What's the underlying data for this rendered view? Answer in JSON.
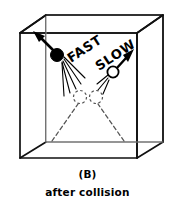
{
  "figure": {
    "panel_label": "(B)",
    "title": "after collision",
    "labels": {
      "fast": "FAST",
      "slow": "SLOW"
    },
    "colors": {
      "ink": "#000000",
      "background": "#ffffff",
      "dark_ball_fill": "#000000",
      "light_ball_fill": "#ffffff",
      "ghost_dash": "#555555",
      "cube_edge": "#1a1a1a"
    },
    "scene": {
      "container_shape": "cube",
      "cube": {
        "front_top_left": [
          20,
          33
        ],
        "front_top_right": [
          137,
          33
        ],
        "front_bottom_left": [
          20,
          158
        ],
        "front_bottom_right": [
          137,
          158
        ],
        "back_top_left": [
          46,
          15
        ],
        "back_top_right": [
          163,
          15
        ],
        "back_bottom_left": [
          46,
          142
        ],
        "back_bottom_right": [
          163,
          142
        ]
      },
      "balls": [
        {
          "name": "fast-dark-ball",
          "label": "FAST",
          "fill": "solid",
          "center": [
            57,
            55
          ],
          "radius": 6.5,
          "direction": "up-left",
          "arrow_tip": [
            34,
            32
          ],
          "speed_lines": 5,
          "speed": "fast"
        },
        {
          "name": "slow-light-ball",
          "label": "SLOW",
          "fill": "open",
          "center": [
            113,
            72
          ],
          "radius": 5.5,
          "direction": "up-right",
          "arrow_tip": [
            133,
            50
          ],
          "speed_lines": 3,
          "speed": "slow"
        }
      ],
      "collision_point": [
        88,
        97
      ],
      "ghost_balls": [
        {
          "name": "ghost-ball-left",
          "center": [
            80,
            97
          ],
          "radius": 6.5
        },
        {
          "name": "ghost-ball-right",
          "center": [
            96,
            97
          ],
          "radius": 6.5
        }
      ],
      "incoming_dashed_paths": [
        {
          "name": "incoming-path-left",
          "from": [
            52,
            140
          ],
          "to": [
            78,
            104
          ]
        },
        {
          "name": "incoming-path-right",
          "from": [
            124,
            140
          ],
          "to": [
            98,
            104
          ]
        }
      ]
    }
  }
}
